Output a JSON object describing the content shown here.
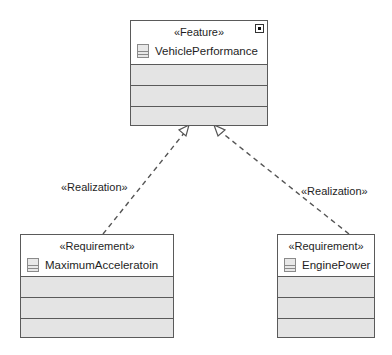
{
  "diagram": {
    "nodes": [
      {
        "id": "vehicle-performance",
        "stereotype": "«Feature»",
        "name": "VehiclePerformance",
        "icon": "class-icon",
        "has_shortcut_marker": true,
        "compartments": 3
      },
      {
        "id": "maximum-acceleration",
        "stereotype": "«Requirement»",
        "name": "MaximumAcceleratoin",
        "icon": "class-icon",
        "has_shortcut_marker": false,
        "compartments": 3
      },
      {
        "id": "engine-power",
        "stereotype": "«Requirement»",
        "name": "EnginePower",
        "icon": "class-icon",
        "has_shortcut_marker": false,
        "compartments": 3
      }
    ],
    "edges": [
      {
        "from": "maximum-acceleration",
        "to": "vehicle-performance",
        "stereotype": "«Realization»",
        "style": "dashed",
        "arrow": "hollow-triangle"
      },
      {
        "from": "engine-power",
        "to": "vehicle-performance",
        "stereotype": "«Realization»",
        "style": "dashed",
        "arrow": "hollow-triangle"
      }
    ]
  }
}
